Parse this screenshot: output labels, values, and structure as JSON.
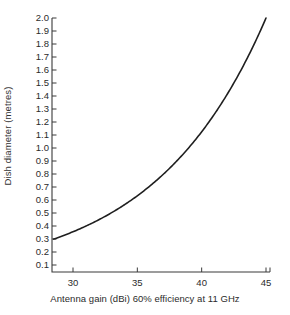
{
  "chart_data": {
    "type": "line",
    "title": "",
    "xlabel": "Antenna gain (dBi) 60% efficiency at 11 GHz",
    "ylabel": "Dish diameter (metres)",
    "xlim": [
      28.3,
      45.6
    ],
    "ylim": [
      0.0,
      2.05
    ],
    "grid": false,
    "legend": null,
    "xticks": [
      30,
      35,
      40,
      45
    ],
    "xtick_labels": [
      "30",
      "35",
      "40",
      "45"
    ],
    "yticks": [
      0.1,
      0.2,
      0.3,
      0.4,
      0.5,
      0.6,
      0.7,
      0.8,
      0.9,
      1.0,
      1.1,
      1.2,
      1.3,
      1.4,
      1.5,
      1.6,
      1.7,
      1.8,
      1.9,
      2.0
    ],
    "ytick_labels": [
      "0.1",
      "0.2",
      "0.3",
      "0.4",
      "0.5",
      "0.6",
      "0.7",
      "0.8",
      "0.9",
      "1.0",
      "1.1",
      "1.2",
      "1.3",
      "1.4",
      "1.5",
      "1.6",
      "1.7",
      "1.8",
      "1.9",
      "2.0"
    ],
    "series": [
      {
        "name": "Dish diameter vs antenna gain",
        "color": "#1f1f1f",
        "x": [
          28.5,
          29.0,
          30.0,
          31.0,
          32.0,
          33.0,
          34.0,
          35.0,
          36.0,
          37.0,
          38.0,
          39.0,
          40.0,
          41.0,
          42.0,
          43.0,
          44.0,
          45.0
        ],
        "y": [
          0.3,
          0.32,
          0.36,
          0.4,
          0.45,
          0.5,
          0.57,
          0.7,
          0.72,
          0.81,
          0.91,
          1.02,
          1.15,
          1.29,
          1.44,
          1.62,
          1.82,
          2.0
        ]
      }
    ],
    "annotations": []
  }
}
